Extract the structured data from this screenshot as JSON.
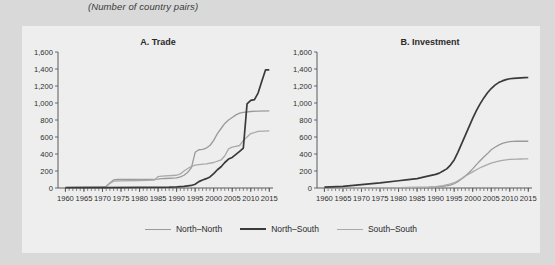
{
  "subtitle": "(Number of country pairs)",
  "colors": {
    "background": "#d9d9d9",
    "panel": "#eeeeee",
    "north_north": "#9a9a9a",
    "north_south": "#3a3a3a",
    "south_south": "#a9a9a9",
    "axis": "#4a4a4a",
    "text": "#2b2b2b"
  },
  "legend": {
    "position": "bottom-center",
    "items": [
      {
        "label": "North–North",
        "color": "#9a9a9a",
        "width": 1.3
      },
      {
        "label": "North–South",
        "color": "#3a3a3a",
        "width": 2.0
      },
      {
        "label": "South–South",
        "color": "#a9a9a9",
        "width": 1.3
      }
    ]
  },
  "chart_data": [
    {
      "type": "line",
      "panel": "A",
      "title": "A. Trade",
      "xlabel": "",
      "ylabel": "",
      "ylim": [
        0,
        1600
      ],
      "yticks": [
        0,
        200,
        400,
        600,
        800,
        1000,
        1200,
        1400,
        1600
      ],
      "yticklabels": [
        "0",
        "200",
        "400",
        "600",
        "800",
        "1,000",
        "1,200",
        "1,400",
        "1,600"
      ],
      "xlim": [
        1958,
        2016
      ],
      "xticks": [
        1960,
        1965,
        1970,
        1975,
        1980,
        1985,
        1990,
        1995,
        2000,
        2005,
        2010,
        2015
      ],
      "xticklabels": [
        "1960",
        "1965",
        "1970",
        "1975",
        "1980",
        "1985",
        "1990",
        "1995",
        "2000",
        "2005",
        "2010",
        "2015"
      ],
      "grid": false,
      "series": [
        {
          "name": "North–North",
          "color": "#9a9a9a",
          "x": [
            1960,
            1965,
            1970,
            1971,
            1972,
            1973,
            1974,
            1980,
            1985,
            1986,
            1987,
            1990,
            1991,
            1992,
            1993,
            1994,
            1995,
            1996,
            1997,
            1998,
            1999,
            2000,
            2001,
            2002,
            2003,
            2004,
            2005,
            2006,
            2007,
            2008,
            2010,
            2012,
            2015
          ],
          "y": [
            10,
            12,
            15,
            20,
            60,
            95,
            100,
            100,
            105,
            110,
            112,
            120,
            130,
            150,
            185,
            240,
            420,
            450,
            455,
            470,
            500,
            560,
            640,
            700,
            760,
            800,
            830,
            860,
            880,
            890,
            900,
            905,
            908
          ]
        },
        {
          "name": "North–South",
          "color": "#3a3a3a",
          "x": [
            1960,
            1970,
            1980,
            1988,
            1990,
            1992,
            1994,
            1995,
            1996,
            1997,
            1998,
            1999,
            2000,
            2001,
            2002,
            2003,
            2004,
            2005,
            2006,
            2007,
            2008,
            2009,
            2010,
            2011,
            2012,
            2013,
            2014,
            2015
          ],
          "y": [
            3,
            5,
            8,
            10,
            14,
            20,
            30,
            45,
            75,
            95,
            110,
            130,
            170,
            215,
            250,
            300,
            340,
            360,
            395,
            430,
            470,
            990,
            1030,
            1040,
            1120,
            1260,
            1390,
            1390
          ]
        },
        {
          "name": "South–South",
          "color": "#a9a9a9",
          "x": [
            1960,
            1965,
            1970,
            1971,
            1972,
            1973,
            1975,
            1980,
            1984,
            1985,
            1986,
            1990,
            1991,
            1992,
            1993,
            1994,
            1995,
            1996,
            1998,
            2000,
            2002,
            2003,
            2004,
            2005,
            2006,
            2007,
            2008,
            2009,
            2010,
            2012,
            2015
          ],
          "y": [
            8,
            10,
            12,
            18,
            55,
            80,
            85,
            88,
            92,
            135,
            140,
            150,
            165,
            200,
            230,
            255,
            270,
            275,
            285,
            300,
            330,
            380,
            460,
            480,
            490,
            500,
            560,
            600,
            640,
            665,
            672
          ]
        }
      ]
    },
    {
      "type": "line",
      "panel": "B",
      "title": "B. Investment",
      "xlabel": "",
      "ylabel": "",
      "ylim": [
        0,
        1600
      ],
      "yticks": [
        0,
        200,
        400,
        600,
        800,
        1000,
        1200,
        1400,
        1600
      ],
      "yticklabels": [
        "0",
        "200",
        "400",
        "600",
        "800",
        "1,000",
        "1,200",
        "1,400",
        "1,600"
      ],
      "xlim": [
        1958,
        2016
      ],
      "xticks": [
        1960,
        1965,
        1970,
        1975,
        1980,
        1985,
        1990,
        1995,
        2000,
        2005,
        2010,
        2015
      ],
      "xticklabels": [
        "1960",
        "1965",
        "1970",
        "1975",
        "1980",
        "1985",
        "1990",
        "1995",
        "2000",
        "2005",
        "2010",
        "2015"
      ],
      "grid": false,
      "series": [
        {
          "name": "North–South",
          "color": "#3a3a3a",
          "x": [
            1960,
            1965,
            1970,
            1975,
            1980,
            1982,
            1985,
            1987,
            1990,
            1991,
            1992,
            1993,
            1994,
            1995,
            1996,
            1997,
            1998,
            1999,
            2000,
            2001,
            2002,
            2003,
            2004,
            2005,
            2006,
            2007,
            2008,
            2009,
            2010,
            2011,
            2012,
            2013,
            2014,
            2015
          ],
          "y": [
            10,
            20,
            40,
            60,
            85,
            95,
            110,
            130,
            160,
            175,
            200,
            225,
            270,
            330,
            420,
            520,
            620,
            720,
            820,
            910,
            990,
            1060,
            1120,
            1170,
            1210,
            1240,
            1260,
            1275,
            1285,
            1290,
            1292,
            1295,
            1298,
            1300
          ]
        },
        {
          "name": "North–North",
          "color": "#9a9a9a",
          "x": [
            1960,
            1970,
            1980,
            1985,
            1988,
            1990,
            1992,
            1994,
            1995,
            1996,
            1997,
            1998,
            1999,
            2000,
            2001,
            2002,
            2003,
            2004,
            2005,
            2006,
            2007,
            2008,
            2009,
            2010,
            2011,
            2012,
            2013,
            2014,
            2015
          ],
          "y": [
            2,
            3,
            5,
            6,
            8,
            12,
            20,
            35,
            50,
            75,
            105,
            140,
            180,
            225,
            275,
            320,
            365,
            405,
            450,
            480,
            505,
            525,
            538,
            545,
            548,
            550,
            550,
            550,
            550
          ]
        },
        {
          "name": "South–South",
          "color": "#a9a9a9",
          "x": [
            1960,
            1970,
            1980,
            1985,
            1988,
            1990,
            1992,
            1994,
            1995,
            1996,
            1997,
            1998,
            1999,
            2000,
            2001,
            2002,
            2003,
            2004,
            2005,
            2006,
            2007,
            2008,
            2009,
            2010,
            2012,
            2013,
            2014,
            2015
          ],
          "y": [
            2,
            3,
            5,
            7,
            10,
            16,
            28,
            48,
            62,
            85,
            110,
            140,
            165,
            190,
            215,
            238,
            258,
            275,
            292,
            305,
            315,
            325,
            332,
            337,
            340,
            341,
            342,
            342
          ]
        }
      ]
    }
  ]
}
